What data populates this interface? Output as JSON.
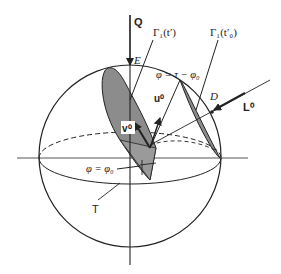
{
  "diagram": {
    "type": "spherical geometry diagram",
    "colors": {
      "stroke": "#222222",
      "shade": "#8c8c8c",
      "background": "#ffffff"
    },
    "labels": {
      "Q": "Q",
      "E": "E",
      "gamma_t_prime": "Γ₁(t′)",
      "gamma_t0_prime": "Γ₁(t′₀)",
      "phi_tau": "φ = τ − φ₀",
      "u0": "u⁰",
      "v0": "v⁰",
      "D": "D",
      "L0": "L⁰",
      "phi_phi0": "φ = φ₀",
      "T": "T"
    }
  }
}
